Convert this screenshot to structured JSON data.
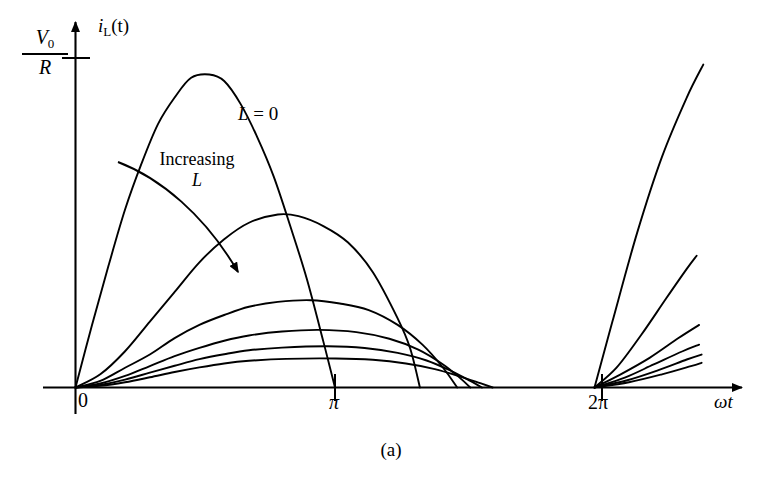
{
  "figure": {
    "caption": "(a)",
    "background_color": "#ffffff",
    "line_color": "#000000"
  },
  "axes": {
    "y": {
      "name_main": "i",
      "name_sub": "L",
      "name_arg": "(t)",
      "tick_label_numerator": "V",
      "tick_label_numerator_sub": "0",
      "tick_label_denominator": "R"
    },
    "x": {
      "name": "ωt",
      "tick_labels": [
        "0",
        "π",
        "2π"
      ]
    }
  },
  "annotations": {
    "curve_l0": {
      "var": "L",
      "eq": " = 0"
    },
    "increasing": {
      "line1": "Increasing",
      "line2": "L"
    }
  },
  "chart_data": {
    "type": "line",
    "title": "",
    "subtitle": "",
    "caption": "(a)",
    "xlabel": "ωt",
    "ylabel": "i_L(t)",
    "xlim": [
      0,
      7.6
    ],
    "ylim": [
      0,
      1.12
    ],
    "grid": false,
    "legend_position": "inline-annotation",
    "xticks": [
      {
        "value": 0,
        "label": "0"
      },
      {
        "value": 3.14159,
        "label": "π"
      },
      {
        "value": 6.28319,
        "label": "2π"
      }
    ],
    "yticks": [
      {
        "value": 1.0,
        "label": "V0/R"
      }
    ],
    "annotations": [
      {
        "text": "L = 0",
        "x": 3.35,
        "y": 0.8,
        "target_series": "L = 0"
      },
      {
        "text": "Increasing L",
        "x": 1.95,
        "y": 0.68,
        "arrow_from": [
          1.25,
          0.66
        ],
        "arrow_to": [
          2.55,
          0.3
        ],
        "arrow_style": "curved"
      }
    ],
    "series": [
      {
        "name": "L = 0",
        "label": "L = 0",
        "peak_value": 0.95,
        "peak_x": 1.62,
        "conduction_end_x": 3.14159,
        "points_cycle1": [
          [
            0.0,
            0.0
          ],
          [
            0.2,
            0.19
          ],
          [
            0.4,
            0.37
          ],
          [
            0.6,
            0.54
          ],
          [
            0.8,
            0.68
          ],
          [
            1.0,
            0.8
          ],
          [
            1.2,
            0.88
          ],
          [
            1.4,
            0.94
          ],
          [
            1.62,
            0.95
          ],
          [
            1.8,
            0.93
          ],
          [
            2.0,
            0.86
          ],
          [
            2.2,
            0.76
          ],
          [
            2.4,
            0.64
          ],
          [
            2.6,
            0.49
          ],
          [
            2.8,
            0.33
          ],
          [
            3.0,
            0.14
          ],
          [
            3.14159,
            0.0
          ]
        ],
        "points_cycle2": [
          [
            6.28319,
            0.0
          ],
          [
            6.5,
            0.2
          ],
          [
            6.8,
            0.47
          ],
          [
            7.1,
            0.7
          ],
          [
            7.4,
            0.88
          ],
          [
            7.6,
            0.98
          ]
        ]
      },
      {
        "name": "curve-2",
        "label": "",
        "peak_value": 0.525,
        "peak_x": 2.45,
        "conduction_end_x": 4.17,
        "points_cycle1": [
          [
            0.0,
            0.0
          ],
          [
            0.3,
            0.04
          ],
          [
            0.6,
            0.11
          ],
          [
            0.9,
            0.2
          ],
          [
            1.2,
            0.29
          ],
          [
            1.5,
            0.38
          ],
          [
            1.8,
            0.45
          ],
          [
            2.1,
            0.5
          ],
          [
            2.45,
            0.525
          ],
          [
            2.7,
            0.52
          ],
          [
            3.0,
            0.49
          ],
          [
            3.3,
            0.44
          ],
          [
            3.6,
            0.35
          ],
          [
            3.9,
            0.21
          ],
          [
            4.05,
            0.12
          ],
          [
            4.17,
            0.0
          ]
        ],
        "points_cycle2": [
          [
            6.28319,
            0.0
          ],
          [
            6.55,
            0.06
          ],
          [
            6.85,
            0.16
          ],
          [
            7.15,
            0.27
          ],
          [
            7.4,
            0.36
          ],
          [
            7.52,
            0.4
          ]
        ]
      },
      {
        "name": "curve-3",
        "label": "",
        "peak_value": 0.265,
        "peak_x": 2.85,
        "conduction_end_x": 4.62,
        "points_cycle1": [
          [
            0.0,
            0.0
          ],
          [
            0.3,
            0.02
          ],
          [
            0.6,
            0.06
          ],
          [
            0.9,
            0.1
          ],
          [
            1.2,
            0.15
          ],
          [
            1.5,
            0.19
          ],
          [
            1.8,
            0.22
          ],
          [
            2.1,
            0.245
          ],
          [
            2.45,
            0.26
          ],
          [
            2.85,
            0.265
          ],
          [
            3.2,
            0.255
          ],
          [
            3.55,
            0.235
          ],
          [
            3.9,
            0.19
          ],
          [
            4.2,
            0.13
          ],
          [
            4.45,
            0.06
          ],
          [
            4.62,
            0.0
          ]
        ],
        "points_cycle2": [
          [
            6.28319,
            0.0
          ],
          [
            6.6,
            0.04
          ],
          [
            6.95,
            0.09
          ],
          [
            7.3,
            0.15
          ],
          [
            7.55,
            0.19
          ]
        ]
      },
      {
        "name": "curve-4",
        "label": "",
        "peak_value": 0.175,
        "peak_x": 2.95,
        "conduction_end_x": 4.78,
        "points_cycle1": [
          [
            0.0,
            0.0
          ],
          [
            0.3,
            0.012
          ],
          [
            0.6,
            0.035
          ],
          [
            0.9,
            0.065
          ],
          [
            1.2,
            0.095
          ],
          [
            1.5,
            0.12
          ],
          [
            1.8,
            0.142
          ],
          [
            2.1,
            0.158
          ],
          [
            2.5,
            0.17
          ],
          [
            2.95,
            0.175
          ],
          [
            3.4,
            0.168
          ],
          [
            3.8,
            0.148
          ],
          [
            4.15,
            0.115
          ],
          [
            4.45,
            0.07
          ],
          [
            4.65,
            0.03
          ],
          [
            4.78,
            0.0
          ]
        ],
        "points_cycle2": [
          [
            6.28319,
            0.0
          ],
          [
            6.65,
            0.03
          ],
          [
            7.0,
            0.07
          ],
          [
            7.35,
            0.11
          ],
          [
            7.55,
            0.13
          ]
        ]
      },
      {
        "name": "curve-5",
        "label": "",
        "peak_value": 0.125,
        "peak_x": 3.05,
        "conduction_end_x": 4.92,
        "points_cycle1": [
          [
            0.0,
            0.0
          ],
          [
            0.3,
            0.008
          ],
          [
            0.6,
            0.024
          ],
          [
            0.9,
            0.045
          ],
          [
            1.2,
            0.066
          ],
          [
            1.5,
            0.086
          ],
          [
            1.8,
            0.101
          ],
          [
            2.1,
            0.113
          ],
          [
            2.5,
            0.121
          ],
          [
            3.05,
            0.125
          ],
          [
            3.5,
            0.12
          ],
          [
            3.9,
            0.105
          ],
          [
            4.25,
            0.082
          ],
          [
            4.55,
            0.05
          ],
          [
            4.78,
            0.02
          ],
          [
            4.92,
            0.0
          ]
        ],
        "points_cycle2": [
          [
            6.28319,
            0.0
          ],
          [
            6.68,
            0.022
          ],
          [
            7.05,
            0.052
          ],
          [
            7.4,
            0.085
          ],
          [
            7.58,
            0.1
          ]
        ]
      },
      {
        "name": "curve-6",
        "label": "",
        "peak_value": 0.088,
        "peak_x": 3.15,
        "conduction_end_x": 5.05,
        "points_cycle1": [
          [
            0.0,
            0.0
          ],
          [
            0.3,
            0.005
          ],
          [
            0.6,
            0.016
          ],
          [
            0.9,
            0.031
          ],
          [
            1.2,
            0.047
          ],
          [
            1.5,
            0.061
          ],
          [
            1.8,
            0.073
          ],
          [
            2.1,
            0.081
          ],
          [
            2.55,
            0.087
          ],
          [
            3.15,
            0.088
          ],
          [
            3.6,
            0.084
          ],
          [
            4.0,
            0.073
          ],
          [
            4.35,
            0.056
          ],
          [
            4.65,
            0.034
          ],
          [
            4.9,
            0.013
          ],
          [
            5.05,
            0.0
          ]
        ],
        "points_cycle2": [
          [
            6.28319,
            0.0
          ],
          [
            6.7,
            0.016
          ],
          [
            7.1,
            0.04
          ],
          [
            7.45,
            0.065
          ],
          [
            7.58,
            0.075
          ]
        ]
      }
    ]
  }
}
